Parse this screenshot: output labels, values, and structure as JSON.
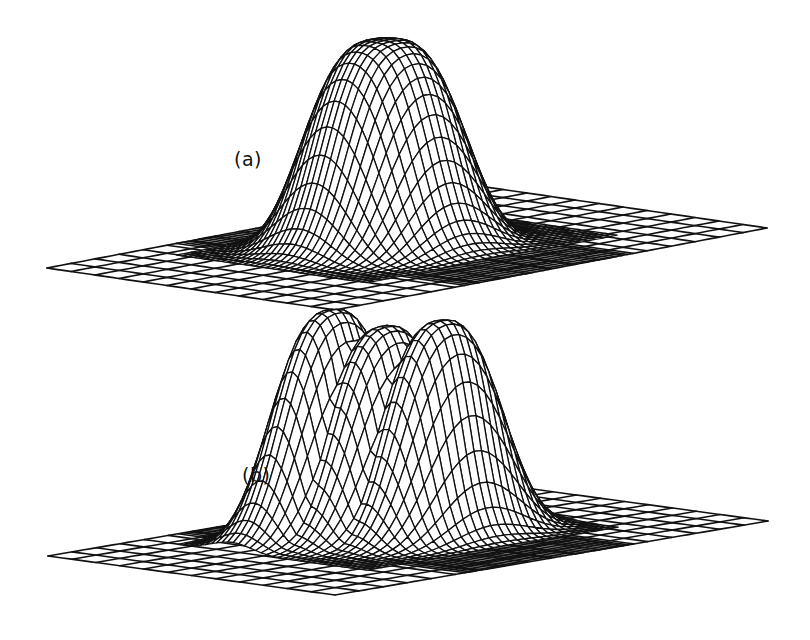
{
  "figure": {
    "panels": [
      {
        "id": "a",
        "label": "(a)"
      },
      {
        "id": "b",
        "label": "(b)"
      }
    ]
  },
  "chart_data": [
    {
      "type": "surface-wireframe",
      "title": "",
      "panel_label": "(a)",
      "description": "Single broad flat-topped peak over a flat rectangular grid plane",
      "xlabel": "",
      "ylabel": "",
      "zlabel": "",
      "grid": true,
      "plane_corners_px": {
        "left": [
          47,
          268
        ],
        "front": [
          335,
          310
        ],
        "right": [
          767,
          228
        ],
        "back": [
          400,
          195
        ]
      },
      "peaks": [
        {
          "name": "main",
          "apex_px": [
            478,
            42
          ],
          "shape": "flat-top gaussian",
          "relative_height": 1.0
        }
      ],
      "colors": {
        "line": "#111111",
        "background": "#ffffff"
      }
    },
    {
      "type": "surface-wireframe",
      "title": "",
      "panel_label": "(b)",
      "description": "Peak split into three narrow sub-peaks over a flat rectangular grid plane",
      "xlabel": "",
      "ylabel": "",
      "zlabel": "",
      "grid": true,
      "plane_corners_px": {
        "left": [
          48,
          556
        ],
        "front": [
          335,
          595
        ],
        "right": [
          768,
          521
        ],
        "back": [
          400,
          490
        ]
      },
      "peaks": [
        {
          "name": "left",
          "apex_px": [
            448,
            327
          ],
          "relative_height": 1.0
        },
        {
          "name": "middle",
          "apex_px": [
            478,
            336
          ],
          "relative_height": 0.95
        },
        {
          "name": "right",
          "apex_px": [
            512,
            331
          ],
          "relative_height": 0.97
        }
      ],
      "colors": {
        "line": "#111111",
        "background": "#ffffff"
      }
    }
  ]
}
